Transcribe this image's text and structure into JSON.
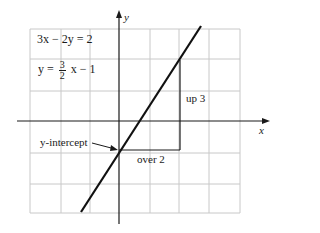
{
  "diagram": {
    "title_equation": "3x − 2y = 2",
    "slope_form": {
      "lhs": "y =",
      "numerator": "3",
      "denominator": "2",
      "rhs": "x − 1"
    },
    "axes": {
      "x_label": "x",
      "y_label": "y"
    },
    "annotations": {
      "rise": "up 3",
      "run": "over 2",
      "intercept": "y-intercept"
    },
    "colors": {
      "grid": "#c8c8c8",
      "axis": "#1a1a1a",
      "line": "#111111"
    }
  }
}
